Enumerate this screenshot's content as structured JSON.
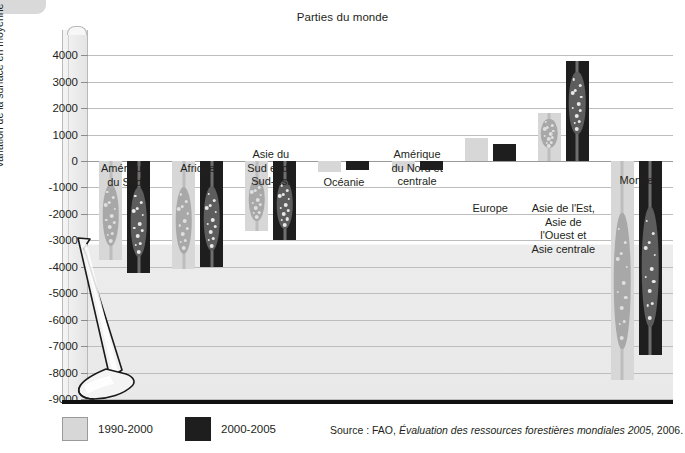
{
  "chart_title": "Parties du monde",
  "y_axis_title": "Variation de la surface en moyenne par année (en milliers d'hectares)",
  "legend": {
    "items": [
      {
        "label": "1990-2000",
        "color": "#d7d7d7"
      },
      {
        "label": "2000-2005",
        "color": "#1e1e1e"
      }
    ]
  },
  "source": {
    "prefix": "Source : FAO, ",
    "italic": "Évaluation des ressources forestières mondiales 2005",
    "suffix": ", 2006."
  },
  "chart_data": {
    "type": "bar",
    "title": "Parties du monde",
    "xlabel": "Parties du monde",
    "ylabel": "Variation de la surface en moyenne par année (en milliers d'hectares)",
    "ylim": [
      -9000,
      4500
    ],
    "yticks": [
      4000,
      3000,
      2000,
      1000,
      0,
      -1000,
      -2000,
      -3000,
      -4000,
      -5000,
      -6000,
      -7000,
      -8000,
      -9000
    ],
    "ytick_labels": [
      "4000",
      "3000",
      "2000",
      "1000",
      "0",
      "-1000",
      "-2000",
      "-3000",
      "-4000",
      "-5000",
      "-6000",
      "-7000",
      "-8000",
      "-9000"
    ],
    "grid": true,
    "legend_position": "bottom-left",
    "categories": [
      "Amérique du Sud",
      "Afrique",
      "Asie du Sud et du Sud-Est",
      "Océanie",
      "Amérique du Nord et centrale",
      "Europe",
      "Asie de l'Est, Asie de l'Ouest et Asie centrale",
      "Monde"
    ],
    "series": [
      {
        "name": "1990-2000",
        "color": "#d7d7d7",
        "values": [
          -3750,
          -4100,
          -2650,
          -400,
          -350,
          870,
          1800,
          -8300
        ]
      },
      {
        "name": "2000-2005",
        "color": "#1e1e1e",
        "values": [
          -4250,
          -4000,
          -3000,
          -350,
          -330,
          660,
          3800,
          -7350
        ]
      }
    ]
  },
  "category_labels": [
    {
      "key": "amerique-du-sud",
      "line1": "Amérique",
      "line2": "du Sud"
    },
    {
      "key": "afrique",
      "line1": "Afrique",
      "line2": ""
    },
    {
      "key": "asie-du-sud-et-du-sud-est",
      "line1": "Asie du",
      "line2": "Sud et du",
      "line3": "Sud-Est"
    },
    {
      "key": "oceanie",
      "line1": "Océanie",
      "line2": ""
    },
    {
      "key": "amerique-du-nord-et-centrale",
      "line1": "Amérique",
      "line2": "du Nord et",
      "line3": "centrale"
    },
    {
      "key": "europe",
      "line1": "Europe",
      "line2": ""
    },
    {
      "key": "asie-de-lest",
      "line1": "Asie de l'Est,",
      "line2": "Asie de",
      "line3": "l'Ouest et",
      "line4": "Asie centrale"
    },
    {
      "key": "monde",
      "line1": "Monde",
      "line2": ""
    }
  ]
}
